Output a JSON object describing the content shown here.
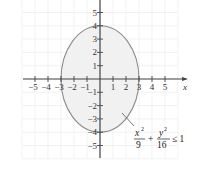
{
  "chart_data": {
    "type": "area",
    "title": "",
    "xlabel": "x",
    "ylabel": "",
    "xlim": [
      -6,
      6
    ],
    "ylim": [
      -6,
      6
    ],
    "grid": true,
    "x_ticks": [
      -5,
      -4,
      -3,
      -2,
      -1,
      1,
      2,
      3,
      4,
      5
    ],
    "y_ticks": [
      -5,
      -4,
      -3,
      -2,
      -1,
      1,
      2,
      3,
      4,
      5
    ],
    "x_tick_labels": [
      "−5",
      "−4",
      "−3",
      "−2",
      "−1",
      "1",
      "2",
      "3",
      "4",
      "5"
    ],
    "y_tick_labels": [
      "−5",
      "−4",
      "−3",
      "−2",
      "−1",
      "1",
      "2",
      "3",
      "4",
      "5"
    ],
    "series": [
      {
        "name": "ellipse region",
        "shape": "ellipse",
        "center": [
          0,
          0
        ],
        "semi_axis_x": 3,
        "semi_axis_y": 4,
        "filled": true,
        "fill_color": "#f1f1f1",
        "stroke_color": "#8a8a8a"
      }
    ],
    "annotations": [
      {
        "text": "x²/9 + y²/16 ≤ 1",
        "numerator_1": "x",
        "denominator_1": "9",
        "numerator_2": "y",
        "denominator_2": "16",
        "relation": "≤ 1",
        "pointer_to": [
          2.3,
          -2.6
        ]
      }
    ]
  },
  "labels": {
    "axis_x": "x",
    "eq_num1": "x",
    "eq_den1": "9",
    "eq_plus": "+",
    "eq_num2": "y",
    "eq_den2": "16",
    "eq_sup": "2",
    "eq_rel": "≤ 1"
  }
}
